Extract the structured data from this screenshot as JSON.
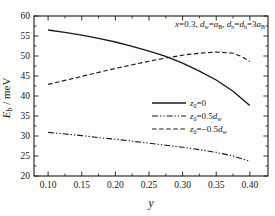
{
  "figure_title": "Donor binding energy vs alloy composition y",
  "chart_data": {
    "type": "line",
    "title": "",
    "xlabel": "y",
    "ylabel": "E_b / meV",
    "xlabel_segments": [
      {
        "t": "y",
        "i": true
      }
    ],
    "ylabel_segments": [
      {
        "t": "E",
        "i": true
      },
      {
        "t": "b",
        "sub": true
      },
      {
        "t": " / meV"
      }
    ],
    "annotation_text": "x=0.3, d_w=a_B, d_b=d_b=3a_B",
    "annotation_segments": [
      {
        "t": "x",
        "i": true
      },
      {
        "t": "=0.3, "
      },
      {
        "t": "d",
        "i": true
      },
      {
        "t": "w",
        "sub": true
      },
      {
        "t": "="
      },
      {
        "t": "a",
        "i": true
      },
      {
        "t": "B",
        "sub": true
      },
      {
        "t": ", "
      },
      {
        "t": "d",
        "i": true
      },
      {
        "t": "b",
        "sub": true
      },
      {
        "t": "="
      },
      {
        "t": "d",
        "i": true
      },
      {
        "t": "b",
        "sub": true
      },
      {
        "t": "=3"
      },
      {
        "t": "a",
        "i": true
      },
      {
        "t": "B",
        "sub": true
      }
    ],
    "xlim": [
      0.079,
      0.427
    ],
    "ylim": [
      20,
      60
    ],
    "x_major_ticks": [
      0.1,
      0.15,
      0.2,
      0.25,
      0.3,
      0.35,
      0.4
    ],
    "x_major_labels": [
      "0.10",
      "0.15",
      "0.20",
      "0.25",
      "0.30",
      "0.35",
      "0.40"
    ],
    "x_minor_ticks": [
      0.125,
      0.175,
      0.225,
      0.275,
      0.325,
      0.375
    ],
    "y_major_ticks": [
      20,
      25,
      30,
      35,
      40,
      45,
      50,
      55,
      60
    ],
    "y_major_labels": [
      "20",
      "25",
      "30",
      "35",
      "40",
      "45",
      "50",
      "55",
      "60"
    ],
    "y_minor_ticks": [
      22.5,
      27.5,
      32.5,
      37.5,
      42.5,
      47.5,
      52.5,
      57.5
    ],
    "grid": false,
    "legend_position": "center-right",
    "axis_color": "#1a1a1a",
    "line_color": "#1a1a1a",
    "series": [
      {
        "name": "z0=0",
        "label_segments": [
          {
            "t": "z",
            "i": true
          },
          {
            "t": "0",
            "sub": true
          },
          {
            "t": "=0"
          }
        ],
        "dash": "solid",
        "x": [
          0.1,
          0.125,
          0.15,
          0.175,
          0.2,
          0.225,
          0.25,
          0.275,
          0.3,
          0.325,
          0.35,
          0.375,
          0.4
        ],
        "y": [
          56.5,
          55.9,
          55.2,
          54.4,
          53.5,
          52.4,
          51.2,
          49.9,
          48.2,
          46.2,
          44.0,
          41.2,
          37.6
        ]
      },
      {
        "name": "z0=0.5dw",
        "label_segments": [
          {
            "t": "z",
            "i": true
          },
          {
            "t": "0",
            "sub": true
          },
          {
            "t": "=0.5"
          },
          {
            "t": "d",
            "i": true
          },
          {
            "t": "w",
            "sub": true
          }
        ],
        "dash": "dashdotdot",
        "x": [
          0.1,
          0.125,
          0.15,
          0.175,
          0.2,
          0.225,
          0.25,
          0.275,
          0.3,
          0.325,
          0.35,
          0.375,
          0.4
        ],
        "y": [
          30.9,
          30.5,
          30.1,
          29.6,
          29.2,
          28.7,
          28.2,
          27.7,
          27.2,
          26.6,
          25.9,
          25.0,
          23.7
        ]
      },
      {
        "name": "z0=-0.5dw",
        "label_segments": [
          {
            "t": "z",
            "i": true
          },
          {
            "t": "0",
            "sub": true
          },
          {
            "t": "=−0.5"
          },
          {
            "t": "d",
            "i": true
          },
          {
            "t": "w",
            "sub": true
          }
        ],
        "dash": "dash",
        "x": [
          0.1,
          0.125,
          0.15,
          0.175,
          0.2,
          0.225,
          0.25,
          0.275,
          0.3,
          0.325,
          0.35,
          0.375,
          0.3875,
          0.4
        ],
        "y": [
          42.9,
          43.9,
          44.9,
          45.9,
          46.9,
          47.8,
          48.7,
          49.5,
          50.2,
          50.7,
          51.0,
          50.7,
          49.9,
          48.6
        ]
      }
    ]
  }
}
